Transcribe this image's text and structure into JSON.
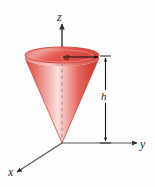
{
  "figure": {
    "background_color": "#fdfdfd"
  },
  "axes": {
    "z": {
      "label": "z",
      "name": "z-axis",
      "color": "#333333"
    },
    "y": {
      "label": "y",
      "name": "y-axis",
      "color": "#555555"
    },
    "x": {
      "label": "x",
      "name": "x-axis",
      "color": "#555555"
    }
  },
  "dimensions": {
    "radius": {
      "label": "a",
      "name": "radius-a",
      "color": "#111111"
    },
    "height": {
      "label": "h",
      "name": "height-h",
      "color": "#111111"
    }
  },
  "cone": {
    "name": "cone-solid",
    "fill_light": "#f7bfbc",
    "fill_mid": "#e8625a",
    "fill_dark": "#cf3b33",
    "rim_color": "#d8463c",
    "top_ellipse_fill": "#e0564e",
    "axis_dash_color": "#b08c8c"
  },
  "geometry": {
    "origin": {
      "x": 62,
      "y": 143
    },
    "top_center": {
      "x": 62,
      "y": 58
    },
    "radius_px": 37,
    "ellipse_ry_px": 8,
    "height_px": 86
  }
}
